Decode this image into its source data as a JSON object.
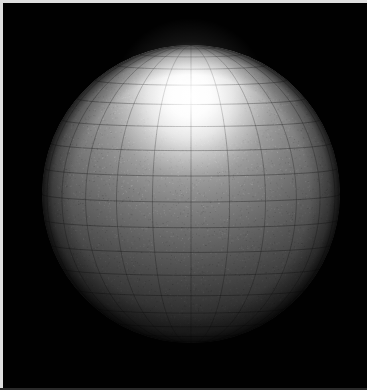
{
  "window": {
    "title": "Shaded Sphere Render",
    "width": 367,
    "height": 390,
    "background_color": "#000000",
    "border_color": "#dedede"
  },
  "scene": {
    "name": "3d-sphere-wireframe-render",
    "description": "Shaded 3D sphere with polar wireframe mesh on black background",
    "background_color": "#010101",
    "render_style": "shaded-wireframe",
    "projection": "orthographic"
  },
  "sphere": {
    "name": "sphere-object",
    "center_x": 191,
    "center_y": 194,
    "radius": 149,
    "surface_color": "#808080",
    "mesh_color": "#3c3c3c",
    "bounds": {
      "left": 42,
      "top": 45,
      "right": 340,
      "bottom": 343
    }
  },
  "lighting": {
    "name": "light-source",
    "type": "point",
    "highlight_x": 190,
    "highlight_y": 96,
    "highlight_color": "#ffffff",
    "highlight_radius": 78,
    "ambient_color": "#2b2b2b",
    "shadow_color": "#111111",
    "falloff": "smooth"
  },
  "mesh": {
    "name": "polar-wireframe",
    "type": "uv-sphere",
    "meridians": 24,
    "parallels": 18,
    "line_color": "#353535",
    "line_width": 0.7,
    "pole_orientation": "toward-viewer-upper",
    "pole_x": 191,
    "pole_y": 186
  },
  "chart_data": {
    "type": "scatter",
    "xlabel": "",
    "ylabel": "",
    "xlim": [
      0,
      367
    ],
    "ylim": [
      0,
      390
    ],
    "grid": false,
    "legend": "none",
    "series": [
      {
        "name": "sphere-silhouette",
        "center": [
          191,
          194
        ],
        "radius": 149
      },
      {
        "name": "specular-highlight",
        "center": [
          190,
          96
        ],
        "radius": 78,
        "peak_luminance": 250
      }
    ],
    "annotations": []
  }
}
